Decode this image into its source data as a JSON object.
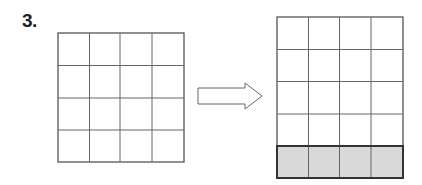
{
  "problem": {
    "number_label": "3.",
    "left_grid": {
      "rows": 4,
      "cols": 4,
      "shaded_rows": []
    },
    "right_grid": {
      "rows": 5,
      "cols": 4,
      "shaded_rows": [
        5
      ]
    },
    "arrow": {
      "direction": "right",
      "style": "outline"
    },
    "colors": {
      "line": "#555555",
      "shade": "#d9d9d9",
      "shade_border": "#333333"
    }
  }
}
